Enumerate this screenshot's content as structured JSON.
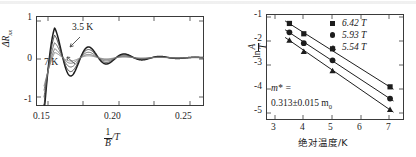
{
  "figure": {
    "panels": [
      "sdh-oscillations",
      "lifshitz-kosevich-fit"
    ]
  },
  "left_panel": {
    "ylabel_main": "ΔR",
    "ylabel_sub": "xx",
    "xlabel_num": "1",
    "xlabel_den": "B",
    "xlabel_unit": "/T",
    "xticks": [
      "0.15",
      "0.20",
      "0.25"
    ],
    "yticks": [
      "1",
      "0",
      "-1"
    ],
    "annotations": [
      {
        "name": "temp-label-high",
        "text": "3.5 K"
      },
      {
        "name": "temp-label-low",
        "text": "7 K"
      }
    ]
  },
  "right_panel": {
    "ylabel_ln": "ln",
    "ylabel_num": "A",
    "ylabel_den": "T",
    "xlabel": "绝对温度/K",
    "xticks": [
      "3",
      "4",
      "5",
      "6",
      "7"
    ],
    "yticks": [
      "-1",
      "-2",
      "-3",
      "-4",
      "-5"
    ],
    "legend": [
      {
        "marker": "square-marker",
        "label": "6.42 T"
      },
      {
        "marker": "circle-marker",
        "label": "5.93 T"
      },
      {
        "marker": "triangle-marker",
        "label": "5.54 T"
      }
    ],
    "mass_annotation_line1": "m* =",
    "mass_annotation_line2": "0.313±0.015 m",
    "mass_annotation_sub": "0"
  },
  "chart_data": [
    {
      "type": "line",
      "name": "sdh-oscillations",
      "title": "",
      "xlabel": "1/B /T",
      "ylabel": "ΔR_xx",
      "xlim": [
        0.1435,
        0.2615
      ],
      "ylim": [
        -1.22,
        1.05
      ],
      "xticks": [
        0.15,
        0.2,
        0.25
      ],
      "yticks": [
        -1,
        0,
        1
      ],
      "grid": false,
      "legend_position": "inline-annotations",
      "annotations": [
        {
          "text": "3.5 K",
          "x": 0.1665,
          "y": 0.8
        },
        {
          "text": "7 K",
          "x": 0.1545,
          "y": -0.33
        }
      ],
      "description": "Shubnikov-de Haas oscillations: damped sinusoid vs inverse field, amplitude decreases with increasing temperature",
      "oscillation_model": {
        "period_inv_tesla": 0.02528,
        "phase_offset": 0.1555,
        "damping_dingle": 42.0,
        "divergence_edge": 0.1485
      },
      "series": [
        {
          "name": "3.5 K",
          "temperature_K": 3.5,
          "amplitude": 0.79,
          "stroke_width": 1.5,
          "color": "#1d1d1d"
        },
        {
          "name": "4 K",
          "temperature_K": 4.0,
          "amplitude": 0.6,
          "stroke_width": 1.0,
          "color": "#3c3c3c"
        },
        {
          "name": "5 K",
          "temperature_K": 5.0,
          "amplitude": 0.4,
          "stroke_width": 0.9,
          "color": "#555555"
        },
        {
          "name": "6 K",
          "temperature_K": 6.0,
          "amplitude": 0.24,
          "stroke_width": 0.9,
          "color": "#6a6a6a"
        },
        {
          "name": "7 K",
          "temperature_K": 7.0,
          "amplitude": 0.14,
          "stroke_width": 0.9,
          "color": "#7d7d7d"
        }
      ]
    },
    {
      "type": "scatter",
      "name": "lifshitz-kosevich-fit",
      "title": "",
      "xlabel": "绝对温度/K",
      "ylabel": "ln A/T",
      "xlim": [
        2.72,
        7.45
      ],
      "ylim": [
        -5.35,
        -0.92
      ],
      "xticks": [
        3,
        4,
        5,
        6,
        7
      ],
      "yticks": [
        -5,
        -4,
        -3,
        -2,
        -1
      ],
      "grid": false,
      "legend_position": "top-right",
      "x": [
        3.5,
        4.0,
        5.0,
        7.0
      ],
      "series": [
        {
          "name": "6.42 T",
          "marker": "square",
          "values": [
            -1.28,
            -1.72,
            -2.36,
            -3.98
          ]
        },
        {
          "name": "5.93 T",
          "marker": "circle",
          "values": [
            -1.66,
            -2.12,
            -2.85,
            -4.48
          ]
        },
        {
          "name": "5.54 T",
          "marker": "triangle",
          "values": [
            -2.0,
            -2.48,
            -3.3,
            -4.95
          ]
        }
      ],
      "fit_lines": [
        {
          "name": "6.42 T",
          "slope": -0.772,
          "intercept": 1.415
        },
        {
          "name": "5.93 T",
          "slope": -0.805,
          "intercept": 1.148
        },
        {
          "name": "5.54 T",
          "slope": -0.845,
          "intercept": 0.955
        }
      ],
      "annotations": [
        {
          "text": "m* =",
          "x": 3.2,
          "y": -4.05
        },
        {
          "text": "0.313±0.015 m0",
          "x": 3.2,
          "y": -4.62
        }
      ]
    }
  ]
}
